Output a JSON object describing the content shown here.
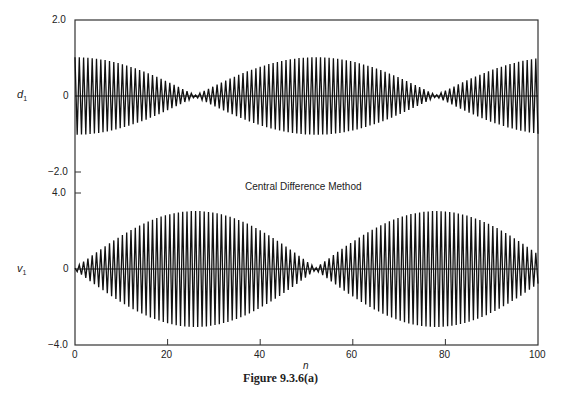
{
  "figure": {
    "caption": "Figure 9.3.6(a)",
    "subtitle": "Central Difference Method",
    "xlabel": "n"
  },
  "chart_data": [
    {
      "type": "line",
      "title": "",
      "ylabel_var": "d",
      "ylabel_sub": "1",
      "xlabel": "n",
      "xlim": [
        0,
        100
      ],
      "ylim": [
        -2.0,
        2.0
      ],
      "ytick_labels": [
        "2.0",
        "0",
        "-2.0"
      ],
      "envelope": "beating: |d1| ≈ 1.0·|cos(π n / 52)| with nodes near n≈26 and n≈78",
      "series": [
        {
          "name": "d1",
          "period_steps": 2,
          "amplitude_max": 1.0,
          "node_n": [
            26,
            78
          ],
          "peak_n": [
            0,
            52,
            100
          ]
        }
      ],
      "grid": false
    },
    {
      "type": "line",
      "title": "Central Difference Method",
      "ylabel_var": "v",
      "ylabel_sub": "1",
      "xlabel": "n",
      "xlim": [
        0,
        100
      ],
      "ylim": [
        -4.0,
        4.0
      ],
      "ytick_labels": [
        "4.0",
        "0",
        "-4.0"
      ],
      "xtick_labels": [
        "0",
        "20",
        "40",
        "60",
        "80",
        "100"
      ],
      "envelope": "beating: |v1| ≈ 3.0·|sin(π n / 52)| with nodes near n≈0 and n≈52, peaks near n≈26 and n≈78",
      "series": [
        {
          "name": "v1",
          "period_steps": 2,
          "amplitude_max": 3.0,
          "node_n": [
            0,
            52
          ],
          "peak_n": [
            26,
            78
          ]
        }
      ],
      "grid": false
    }
  ],
  "axes": {
    "upper_yticks": [
      {
        "label": "2.0",
        "value": 2.0
      },
      {
        "label": "0",
        "value": 0
      },
      {
        "label": "−2.0",
        "value": -2.0
      }
    ],
    "lower_yticks": [
      {
        "label": "4.0",
        "value": 4.0
      },
      {
        "label": "0",
        "value": 0
      },
      {
        "label": "−4.0",
        "value": -4.0
      }
    ],
    "xticks": [
      {
        "label": "0",
        "value": 0
      },
      {
        "label": "20",
        "value": 20
      },
      {
        "label": "40",
        "value": 40
      },
      {
        "label": "60",
        "value": 60
      },
      {
        "label": "80",
        "value": 80
      },
      {
        "label": "100",
        "value": 100
      }
    ]
  }
}
